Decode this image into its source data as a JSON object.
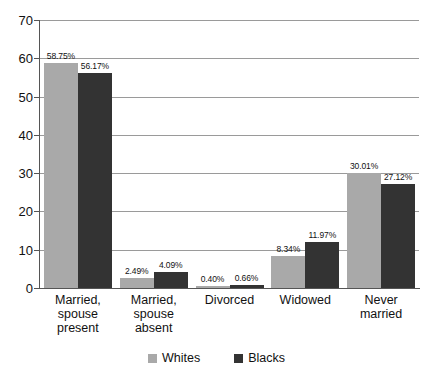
{
  "chart_data": {
    "type": "bar",
    "title": "",
    "subtitle": "",
    "xlabel": "",
    "ylabel": "",
    "ylim": [
      0,
      70
    ],
    "ytick_step": 10,
    "yticks": [
      "0",
      "10",
      "20",
      "30",
      "40",
      "50",
      "60",
      "70"
    ],
    "grid": true,
    "legend_position": "bottom-center",
    "categories": [
      "Married,\nspouse\npresent",
      "Married,\nspouse\nabsent",
      "Divorced",
      "Widowed",
      "Never\nmarried"
    ],
    "category_lines": [
      [
        "Married,",
        "spouse",
        "present"
      ],
      [
        "Married,",
        "spouse",
        "absent"
      ],
      [
        "Divorced"
      ],
      [
        "Widowed"
      ],
      [
        "Never",
        "married"
      ]
    ],
    "series": [
      {
        "name": "Whites",
        "color": "#a9a9a9",
        "values": [
          58.75,
          2.49,
          0.4,
          8.34,
          30.01
        ],
        "labels": [
          "58.75%",
          "2.49%",
          "0.40%",
          "8.34%",
          "30.01%"
        ]
      },
      {
        "name": "Blacks",
        "color": "#333333",
        "values": [
          56.17,
          4.09,
          0.66,
          11.97,
          27.12
        ],
        "labels": [
          "56.17%",
          "4.09%",
          "0.66%",
          "11.97%",
          "27.12%"
        ]
      }
    ]
  },
  "legend": {
    "items": [
      {
        "label": "Whites",
        "swatch": "whites"
      },
      {
        "label": "Blacks",
        "swatch": "blacks"
      }
    ]
  }
}
